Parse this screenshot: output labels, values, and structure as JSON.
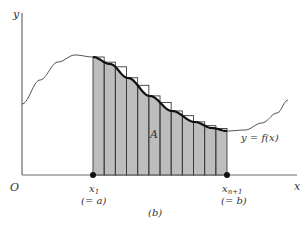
{
  "figure": {
    "caption": "(b)",
    "axes": {
      "x_label": "x",
      "y_label": "y",
      "origin_label": "O"
    },
    "curve_label": "y = f(x)",
    "area_label": "A",
    "left_point": {
      "label": "x",
      "sub": "1",
      "note": "(= a)"
    },
    "right_point": {
      "label": "x",
      "sub": "n+1",
      "note": "(= b)"
    },
    "colors": {
      "shade": "#bdbdbd",
      "stroke": "#3a3a3a",
      "curve": "#555555",
      "axis": "#6b6b6b"
    },
    "rect_count": 12
  }
}
